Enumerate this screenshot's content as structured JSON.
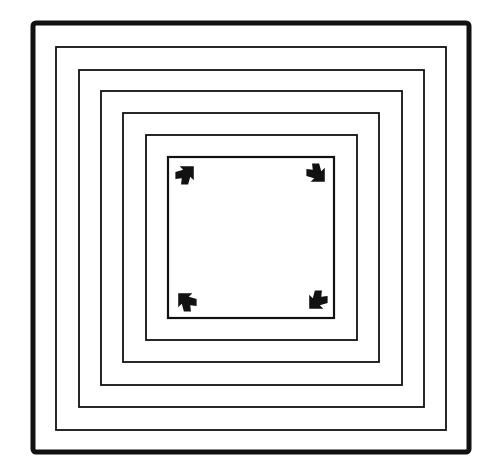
{
  "figure": {
    "stroke_color": "#111111",
    "background": "#ffffff",
    "outer_square": {
      "x": 33,
      "y": 23,
      "width": 436,
      "height": 429,
      "stroke_width": 5
    },
    "inner_squares": [
      {
        "x": 56,
        "y": 47,
        "width": 390,
        "height": 383
      },
      {
        "x": 79,
        "y": 70,
        "width": 345,
        "height": 337
      },
      {
        "x": 101,
        "y": 91,
        "width": 301,
        "height": 294
      },
      {
        "x": 123,
        "y": 113,
        "width": 256,
        "height": 249
      },
      {
        "x": 146,
        "y": 135,
        "width": 211,
        "height": 205
      },
      {
        "x": 168,
        "y": 157,
        "width": 166,
        "height": 161
      }
    ],
    "arrows": [
      {
        "corner": "top-left",
        "cx": 186,
        "cy": 174,
        "rotation": 135
      },
      {
        "corner": "top-right",
        "cx": 317,
        "cy": 174,
        "rotation": 225
      },
      {
        "corner": "bottom-left",
        "cx": 186,
        "cy": 301,
        "rotation": 45
      },
      {
        "corner": "bottom-right",
        "cx": 317,
        "cy": 301,
        "rotation": 315
      }
    ]
  }
}
